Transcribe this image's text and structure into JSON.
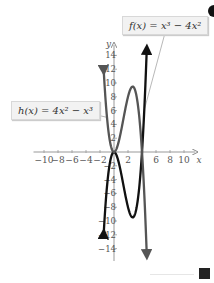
{
  "chart_data": {
    "type": "line",
    "title": "",
    "xlabel": "x",
    "ylabel": "y",
    "xlim": [
      -11,
      11
    ],
    "ylim": [
      -15,
      15
    ],
    "grid": false,
    "x_ticks": [
      -10,
      -8,
      -6,
      -4,
      -2,
      2,
      6,
      8,
      10
    ],
    "x_tick_labels": [
      "−10",
      "−8",
      "−6",
      "−4",
      "−2",
      "2",
      "6",
      "8",
      "10"
    ],
    "y_ticks": [
      14,
      12,
      10,
      8,
      6,
      4,
      2,
      -2,
      -4,
      -6,
      -8,
      -10,
      -12,
      -14
    ],
    "y_tick_labels": [
      "14",
      "12",
      "10",
      "8",
      "6",
      "4",
      "2",
      "−2",
      "−4",
      "−6",
      "−8",
      "−10",
      "−12",
      "−14"
    ],
    "series": [
      {
        "name": "f(x) = x^3 - 4x^2",
        "expression": "x^3 - 4x^2",
        "color": "#111111",
        "x": [
          -1.5,
          -1,
          0,
          1,
          2,
          2.67,
          3,
          4,
          4.7
        ],
        "values": [
          -12.4,
          -5,
          0,
          -3,
          -8,
          -9.5,
          -9,
          0,
          14.5
        ]
      },
      {
        "name": "h(x) = 4x^2 - x^3",
        "expression": "4x^2 - x^3",
        "color": "#555555",
        "x": [
          -1.5,
          -1,
          0,
          1,
          2,
          2.67,
          3,
          4,
          4.7
        ],
        "values": [
          12.4,
          5,
          0,
          3,
          8,
          9.5,
          9,
          0,
          -14.5
        ]
      }
    ],
    "annotations": [
      {
        "text": "f(x) = x³ − 4x²",
        "position": "top-right"
      },
      {
        "text": "h(x) = 4x² − x³",
        "position": "left"
      }
    ]
  },
  "labels": {
    "f_label": "f(x) = x³ − 4x²",
    "h_label": "h(x) = 4x² − x³",
    "x_axis": "x",
    "y_axis": "y"
  },
  "nav": {
    "next_icon": "next-page-icon"
  }
}
